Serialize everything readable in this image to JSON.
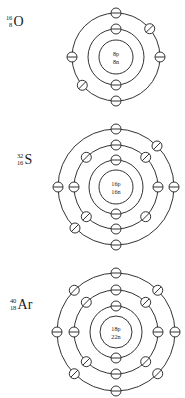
{
  "figure": {
    "background_color": "#ffffff",
    "line_color": "#1c1c1c",
    "width": 185,
    "height": 398
  },
  "atoms": [
    {
      "id": "oxygen",
      "element_symbol": "O",
      "element_name": "Oxygen",
      "mass_number": "16",
      "atomic_number": "8",
      "nucleus_protons_label": "8p",
      "nucleus_neutrons_label": "8n",
      "protons": 8,
      "neutrons": 8,
      "electrons_total": 8,
      "shells": [
        {
          "index": 1,
          "electron_count": 2,
          "radius": 28,
          "marker": "dash"
        },
        {
          "index": 2,
          "electron_count": 6,
          "radius": 44,
          "marker": "mixed"
        }
      ],
      "center_x": 116,
      "center_y": 57,
      "nucleus_radius": 17,
      "label_x": 6,
      "label_y": 14
    },
    {
      "id": "sulfur",
      "element_symbol": "S",
      "element_name": "Sulfur",
      "mass_number": "32",
      "atomic_number": "16",
      "nucleus_protons_label": "16p",
      "nucleus_neutrons_label": "16n",
      "protons": 16,
      "neutrons": 16,
      "electrons_total": 16,
      "shells": [
        {
          "index": 1,
          "electron_count": 2,
          "radius": 27,
          "marker": "dash"
        },
        {
          "index": 2,
          "electron_count": 8,
          "radius": 42,
          "marker": "mixed"
        },
        {
          "index": 3,
          "electron_count": 6,
          "radius": 58,
          "marker": "mixed"
        }
      ],
      "center_x": 116,
      "center_y": 187,
      "nucleus_radius": 17,
      "label_x": 17,
      "label_y": 152
    },
    {
      "id": "argon",
      "element_symbol": "Ar",
      "element_name": "Argon",
      "mass_number": "40",
      "atomic_number": "18",
      "nucleus_protons_label": "18p",
      "nucleus_neutrons_label": "22n",
      "protons": 18,
      "neutrons": 22,
      "electrons_total": 18,
      "shells": [
        {
          "index": 1,
          "electron_count": 2,
          "radius": 26,
          "marker": "dash"
        },
        {
          "index": 2,
          "electron_count": 8,
          "radius": 42,
          "marker": "mixed"
        },
        {
          "index": 3,
          "electron_count": 8,
          "radius": 59,
          "marker": "mixed"
        }
      ],
      "center_x": 116,
      "center_y": 332,
      "nucleus_radius": 16,
      "label_x": 10,
      "label_y": 297
    }
  ]
}
